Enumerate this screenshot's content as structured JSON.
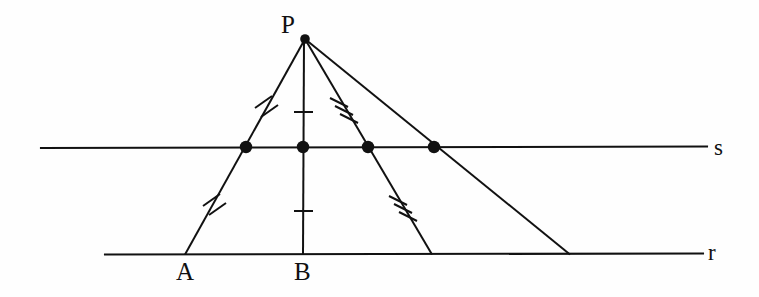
{
  "figure": {
    "background_color": "#fefefe",
    "stroke_color": "#111111",
    "width": 759,
    "height": 297
  },
  "labels": {
    "apex": "P",
    "foot_left": "A",
    "foot_center": "B",
    "line_upper": "s",
    "line_lower": "r"
  },
  "points": {
    "P": {
      "name": "P",
      "x": 305,
      "y": 38
    },
    "A": {
      "name": "A",
      "x": 185,
      "y": 254
    },
    "B": {
      "name": "B",
      "x": 303,
      "y": 254
    },
    "C": {
      "name": "C",
      "x": 432,
      "y": 254
    },
    "D": {
      "name": "D",
      "x": 570,
      "y": 254
    },
    "M1": {
      "name": "M1",
      "x": 246,
      "y": 147
    },
    "M2": {
      "name": "M2",
      "x": 303,
      "y": 147
    },
    "M3": {
      "name": "M3",
      "x": 368,
      "y": 147
    },
    "M4": {
      "name": "M4",
      "x": 434,
      "y": 147
    }
  },
  "lines": {
    "s": {
      "label": "s",
      "x1": 41,
      "y1": 147,
      "x2": 707,
      "y2": 147
    },
    "r": {
      "label": "r",
      "x1": 105,
      "y1": 254,
      "x2": 703,
      "y2": 254
    }
  },
  "segments": [
    {
      "id": "PA",
      "from": "P",
      "to": "A",
      "ticks": 2
    },
    {
      "id": "PB",
      "from": "P",
      "to": "B",
      "ticks": 1
    },
    {
      "id": "PC",
      "from": "P",
      "to": "C",
      "ticks": 3
    },
    {
      "id": "PD",
      "from": "P",
      "to": "D",
      "ticks": 0
    }
  ],
  "tick_groups": [
    {
      "id": "tick-PA-upper",
      "segment": "PA",
      "count": 2,
      "x": 265,
      "y": 104
    },
    {
      "id": "tick-PA-lower",
      "segment": "PA",
      "count": 2,
      "x": 213,
      "y": 202
    },
    {
      "id": "tick-PB-upper",
      "segment": "PB",
      "count": 1,
      "x": 303,
      "y": 112
    },
    {
      "id": "tick-PB-lower",
      "segment": "PB",
      "count": 1,
      "x": 303,
      "y": 211
    },
    {
      "id": "tick-PC-upper",
      "segment": "PC",
      "count": 3,
      "x": 342,
      "y": 107
    },
    {
      "id": "tick-PC-lower",
      "segment": "PC",
      "count": 3,
      "x": 401,
      "y": 205
    }
  ],
  "dots": [
    {
      "id": "dot-M1",
      "x": 246,
      "y": 147,
      "r": 6
    },
    {
      "id": "dot-M2",
      "x": 303,
      "y": 147,
      "r": 6
    },
    {
      "id": "dot-M3",
      "x": 368,
      "y": 147,
      "r": 6
    },
    {
      "id": "dot-M4",
      "x": 434,
      "y": 147,
      "r": 6
    },
    {
      "id": "dot-P",
      "x": 305,
      "y": 39,
      "r": 5
    }
  ],
  "label_positions": {
    "P": {
      "left": 281,
      "top": 12
    },
    "A": {
      "left": 176,
      "top": 259
    },
    "B": {
      "left": 294,
      "top": 259
    },
    "s": {
      "left": 714,
      "top": 135
    },
    "r": {
      "left": 708,
      "top": 240
    }
  }
}
